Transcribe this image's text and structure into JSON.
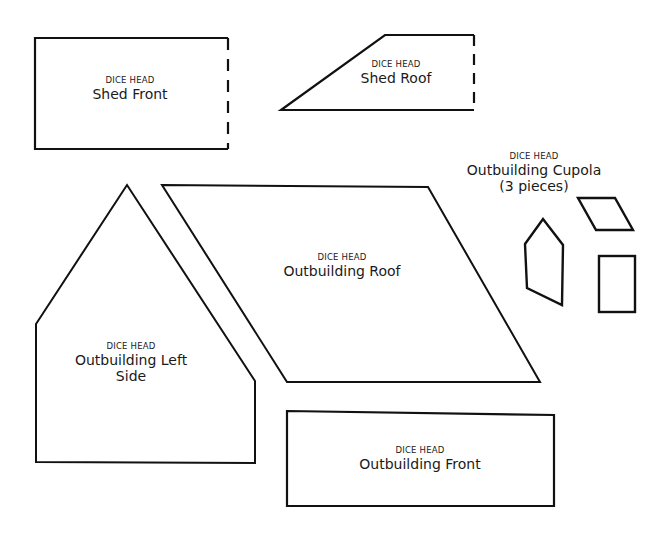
{
  "pieces": [
    {
      "id": "shed-front",
      "brand": "DICE HEAD",
      "name": "Shed Front"
    },
    {
      "id": "shed-roof",
      "brand": "DICE HEAD",
      "name": "Shed Roof"
    },
    {
      "id": "outbuilding-cupola",
      "brand": "DICE HEAD",
      "name": "Outbuilding Cupola",
      "note": "(3 pieces)"
    },
    {
      "id": "outbuilding-roof",
      "brand": "DICE HEAD",
      "name": "Outbuilding Roof"
    },
    {
      "id": "outbuilding-left-side",
      "brand": "DICE HEAD",
      "name": "Outbuilding Left",
      "name_line2": "Side"
    },
    {
      "id": "outbuilding-front",
      "brand": "DICE HEAD",
      "name": "Outbuilding Front"
    }
  ],
  "colors": {
    "stroke": "#111111",
    "background": "#ffffff",
    "text": "#1a1a1a"
  }
}
